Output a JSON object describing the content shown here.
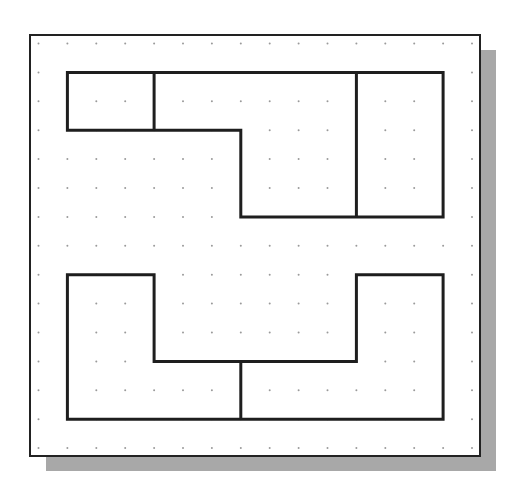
{
  "diagram": {
    "type": "orthographic-sketch-on-dot-grid",
    "colors": {
      "background": "#ffffff",
      "frame": "#222222",
      "shadow": "#a8a8a8",
      "grid_dot": "#9a9a9a",
      "shape_line": "#1e1e1e"
    },
    "frame": {
      "x": 30,
      "y": 35,
      "width": 450,
      "height": 421
    },
    "shadow": {
      "offset_x": 16,
      "offset_y": 15
    },
    "grid": {
      "origin_x": 38.5,
      "origin_y": 43.5,
      "spacing": 28.9,
      "cols": 16,
      "rows": 15
    },
    "top_view": {
      "outline": [
        [
          1,
          1
        ],
        [
          14,
          1
        ],
        [
          14,
          6
        ],
        [
          7,
          6
        ],
        [
          7,
          3
        ],
        [
          1,
          3
        ]
      ],
      "dividers": [
        [
          [
            4,
            1
          ],
          [
            4,
            3
          ]
        ],
        [
          [
            11,
            1
          ],
          [
            11,
            6
          ]
        ]
      ]
    },
    "front_view": {
      "outline": [
        [
          1,
          8
        ],
        [
          4,
          8
        ],
        [
          4,
          11
        ],
        [
          11,
          11
        ],
        [
          11,
          8
        ],
        [
          14,
          8
        ],
        [
          14,
          13
        ],
        [
          1,
          13
        ]
      ],
      "dividers": [
        [
          [
            7,
            11
          ],
          [
            7,
            13
          ]
        ]
      ]
    }
  }
}
